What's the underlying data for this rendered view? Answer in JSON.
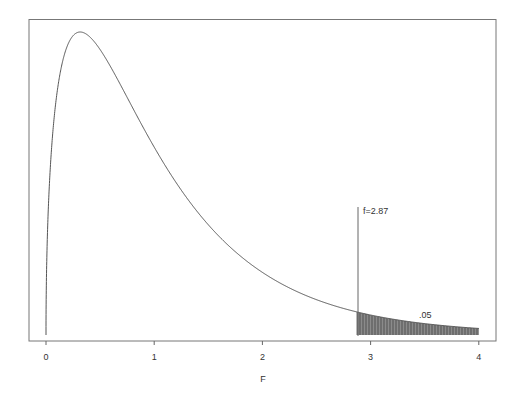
{
  "chart_data": {
    "type": "line",
    "title": "",
    "xlabel": "F",
    "ylabel": "",
    "xlim": [
      0,
      4
    ],
    "x_ticks": [
      0,
      1,
      2,
      3,
      4
    ],
    "x_tick_labels": [
      "0",
      "1",
      "2",
      "3",
      "4"
    ],
    "y_ticks": [],
    "grid": false,
    "legend": null,
    "distribution": "F density (approx. df1=3, df2=36)",
    "series": [
      {
        "name": "F density (relative height)",
        "x": [
          0,
          0.05,
          0.1,
          0.2,
          0.3158,
          0.5,
          0.75,
          1.0,
          1.25,
          1.5,
          1.75,
          2.0,
          2.25,
          2.5,
          2.87,
          3.0,
          3.25,
          3.5,
          3.75,
          4.0
        ],
        "values": [
          0,
          0.66,
          0.88,
          0.99,
          1.0,
          0.94,
          0.8,
          0.62,
          0.47,
          0.35,
          0.27,
          0.21,
          0.155,
          0.115,
          0.077,
          0.066,
          0.05,
          0.038,
          0.029,
          0.022
        ]
      }
    ],
    "annotations": [
      {
        "type": "vline",
        "x": 2.87,
        "label": "f=2.87"
      },
      {
        "type": "shaded_region",
        "from": 2.87,
        "to": 4,
        "label": ".05"
      }
    ]
  },
  "labels": {
    "xlabel": "F",
    "critical": "f=2.87",
    "area": ".05",
    "ticks": [
      "0",
      "1",
      "2",
      "3",
      "4"
    ]
  }
}
